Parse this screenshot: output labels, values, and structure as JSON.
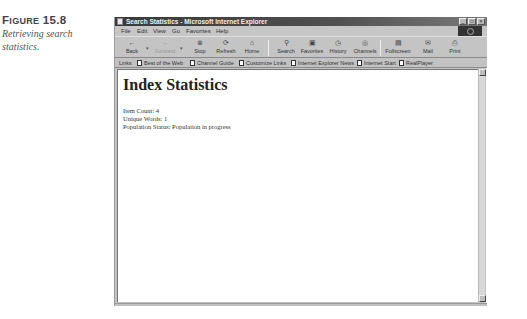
{
  "caption": {
    "figure_word_cap": "F",
    "figure_word_rest": "IGURE",
    "figure_number": "15.8",
    "description": "Retrieving search statistics."
  },
  "window": {
    "title": "Search Statistics - Microsoft Internet Explorer",
    "controls": {
      "minimize": "_",
      "maximize": "□",
      "close": "×"
    }
  },
  "menu": {
    "items": [
      "File",
      "Edit",
      "View",
      "Go",
      "Favorites",
      "Help"
    ]
  },
  "toolbar": {
    "buttons": [
      {
        "label": "Back",
        "icon": "back-arrow-icon",
        "glyph": "←",
        "enabled": true
      },
      {
        "label": "Forward",
        "icon": "forward-arrow-icon",
        "glyph": "→",
        "enabled": false
      },
      {
        "label": "Stop",
        "icon": "stop-icon",
        "glyph": "⊗",
        "enabled": true
      },
      {
        "label": "Refresh",
        "icon": "refresh-icon",
        "glyph": "⟳",
        "enabled": true
      },
      {
        "label": "Home",
        "icon": "home-icon",
        "glyph": "⌂",
        "enabled": true
      },
      {
        "label": "Search",
        "icon": "search-icon",
        "glyph": "⚲",
        "enabled": true
      },
      {
        "label": "Favorites",
        "icon": "favorites-icon",
        "glyph": "▣",
        "enabled": true
      },
      {
        "label": "History",
        "icon": "history-icon",
        "glyph": "◷",
        "enabled": true
      },
      {
        "label": "Channels",
        "icon": "channels-icon",
        "glyph": "◎",
        "enabled": true
      },
      {
        "label": "Fullscreen",
        "icon": "fullscreen-icon",
        "glyph": "▤",
        "enabled": true
      },
      {
        "label": "Mail",
        "icon": "mail-icon",
        "glyph": "✉",
        "enabled": true
      },
      {
        "label": "Print",
        "icon": "print-icon",
        "glyph": "⎙",
        "enabled": true
      }
    ]
  },
  "links_bar": {
    "label": "Links",
    "items": [
      "Best of the Web",
      "Channel Guide",
      "Customize Links",
      "Internet Explorer News",
      "Internet Start",
      "RealPlayer"
    ]
  },
  "page": {
    "heading": "Index Statistics",
    "lines": [
      "Item Count: 4",
      "Unique Words: 1",
      "Population Status: Population in progress"
    ]
  }
}
